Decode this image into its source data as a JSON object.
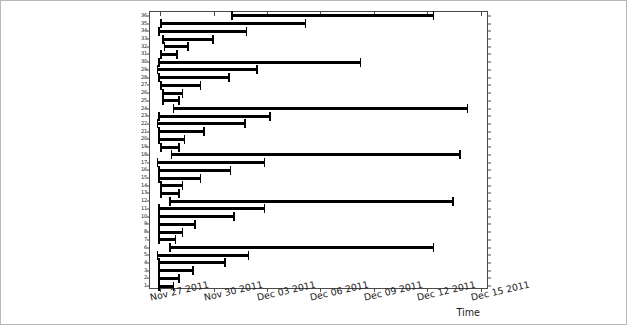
{
  "chart_data": {
    "type": "bar",
    "subtype": "horizontal-interval-bars",
    "title": "",
    "xlabel": "Time",
    "ylabel": "",
    "grid": false,
    "legend": null,
    "xlim": [
      "Nov 26 2011",
      "Dec 16 2011"
    ],
    "ylim": [
      0.5,
      36.5
    ],
    "xticks": [
      "Nov 27 2011",
      "Nov 30 2011",
      "Dec 03 2011",
      "Dec 06 2011",
      "Dec 09 2011",
      "Dec 12 2011",
      "Dec 15 2011"
    ],
    "yticks": [
      "36",
      "35",
      "34",
      "33",
      "32",
      "31",
      "30",
      "29",
      "28",
      "27",
      "26",
      "25",
      "24",
      "23",
      "22",
      "21",
      "20",
      "19",
      "18",
      "17",
      "16",
      "15",
      "14",
      "13",
      "12",
      "11",
      "10",
      "9",
      "8",
      "7",
      "6",
      "5",
      "4",
      "3",
      "2",
      "1"
    ],
    "bar_color": "#000000",
    "axis_color": "#4a4a4a",
    "categories": [
      "1",
      "2",
      "3",
      "4",
      "5",
      "6",
      "7",
      "8",
      "9",
      "10",
      "11",
      "12",
      "13",
      "14",
      "15",
      "16",
      "17",
      "18",
      "19",
      "20",
      "21",
      "22",
      "23",
      "24",
      "25",
      "26",
      "27",
      "28",
      "29",
      "30",
      "31",
      "32",
      "33",
      "34",
      "35",
      "36"
    ],
    "bars": [
      {
        "category": "36",
        "start": "Nov 31 2011",
        "end": "Dec 12 2011",
        "start_day": 4.0,
        "end_day": 15.4
      },
      {
        "category": "35",
        "start": "Nov 27 2011",
        "end": "Dec 05 2011",
        "start_day": 0.0,
        "end_day": 8.2
      },
      {
        "category": "34",
        "start": "Nov 27 2011",
        "end": "Dec 02 2011",
        "start_day": -0.1,
        "end_day": 4.9
      },
      {
        "category": "33",
        "start": "Nov 27 2011",
        "end": "Nov 30 2011",
        "start_day": 0.1,
        "end_day": 3.0
      },
      {
        "category": "32",
        "start": "Nov 27 2011",
        "end": "Nov 28 2011",
        "start_day": 0.2,
        "end_day": 1.6
      },
      {
        "category": "31",
        "start": "Nov 27 2011",
        "end": "Nov 28 2011",
        "start_day": 0.0,
        "end_day": 1.0
      },
      {
        "category": "30",
        "start": "Nov 27 2011",
        "end": "Dec 08 2011",
        "start_day": -0.1,
        "end_day": 11.3
      },
      {
        "category": "29",
        "start": "Nov 27 2011",
        "end": "Dec 02 2011",
        "start_day": -0.2,
        "end_day": 5.5
      },
      {
        "category": "28",
        "start": "Nov 27 2011",
        "end": "Dec 01 2011",
        "start_day": -0.1,
        "end_day": 3.9
      },
      {
        "category": "27",
        "start": "Nov 27 2011",
        "end": "Nov 29 2011",
        "start_day": 0.0,
        "end_day": 2.3
      },
      {
        "category": "26",
        "start": "Nov 27 2011",
        "end": "Nov 28 2011",
        "start_day": 0.1,
        "end_day": 1.3
      },
      {
        "category": "25",
        "start": "Nov 27 2011",
        "end": "Nov 28 2011",
        "start_day": 0.1,
        "end_day": 1.1
      },
      {
        "category": "24",
        "start": "Nov 27 2011",
        "end": "Dec 14 2011",
        "start_day": 0.7,
        "end_day": 17.3
      },
      {
        "category": "23",
        "start": "Nov 27 2011",
        "end": "Dec 03 2011",
        "start_day": -0.1,
        "end_day": 6.2
      },
      {
        "category": "22",
        "start": "Nov 27 2011",
        "end": "Dec 02 2011",
        "start_day": -0.2,
        "end_day": 4.8
      },
      {
        "category": "21",
        "start": "Nov 27 2011",
        "end": "Nov 29 2011",
        "start_day": -0.1,
        "end_day": 2.5
      },
      {
        "category": "20",
        "start": "Nov 27 2011",
        "end": "Nov 28 2011",
        "start_day": -0.1,
        "end_day": 1.4
      },
      {
        "category": "19",
        "start": "Nov 27 2011",
        "end": "Nov 28 2011",
        "start_day": 0.0,
        "end_day": 1.1
      },
      {
        "category": "18",
        "start": "Nov 27 2011",
        "end": "Dec 13 2011",
        "start_day": 0.6,
        "end_day": 16.9
      },
      {
        "category": "17",
        "start": "Nov 27 2011",
        "end": "Dec 02 2011",
        "start_day": -0.2,
        "end_day": 5.9
      },
      {
        "category": "16",
        "start": "Nov 27 2011",
        "end": "Dec 01 2011",
        "start_day": -0.1,
        "end_day": 4.0
      },
      {
        "category": "15",
        "start": "Nov 27 2011",
        "end": "Nov 29 2011",
        "start_day": -0.1,
        "end_day": 2.3
      },
      {
        "category": "14",
        "start": "Nov 27 2011",
        "end": "Nov 28 2011",
        "start_day": 0.0,
        "end_day": 1.3
      },
      {
        "category": "13",
        "start": "Nov 27 2011",
        "end": "Nov 28 2011",
        "start_day": 0.0,
        "end_day": 1.1
      },
      {
        "category": "12",
        "start": "Nov 27 2011",
        "end": "Dec 13 2011",
        "start_day": 0.5,
        "end_day": 16.5
      },
      {
        "category": "11",
        "start": "Nov 27 2011",
        "end": "Dec 03 2011",
        "start_day": -0.1,
        "end_day": 5.9
      },
      {
        "category": "10",
        "start": "Nov 27 2011",
        "end": "Dec 01 2011",
        "start_day": -0.1,
        "end_day": 4.2
      },
      {
        "category": "9",
        "start": "Nov 27 2011",
        "end": "Nov 29 2011",
        "start_day": -0.1,
        "end_day": 2.0
      },
      {
        "category": "8",
        "start": "Nov 27 2011",
        "end": "Nov 28 2011",
        "start_day": -0.1,
        "end_day": 1.3
      },
      {
        "category": "7",
        "start": "Nov 27 2011",
        "end": "Nov 27 2011",
        "start_day": -0.1,
        "end_day": 0.9
      },
      {
        "category": "6",
        "start": "Nov 27 2011",
        "end": "Dec 12 2011",
        "start_day": 0.5,
        "end_day": 15.4
      },
      {
        "category": "5",
        "start": "Nov 27 2011",
        "end": "Dec 02 2011",
        "start_day": -0.2,
        "end_day": 5.0
      },
      {
        "category": "4",
        "start": "Nov 27 2011",
        "end": "Dec 01 2011",
        "start_day": -0.1,
        "end_day": 3.7
      },
      {
        "category": "3",
        "start": "Nov 27 2011",
        "end": "Nov 29 2011",
        "start_day": -0.1,
        "end_day": 1.9
      },
      {
        "category": "2",
        "start": "Nov 27 2011",
        "end": "Nov 28 2011",
        "start_day": -0.1,
        "end_day": 1.1
      },
      {
        "category": "1",
        "start": "Nov 27 2011",
        "end": "Nov 28 2011",
        "start_day": -0.1,
        "end_day": 0.8
      }
    ]
  }
}
